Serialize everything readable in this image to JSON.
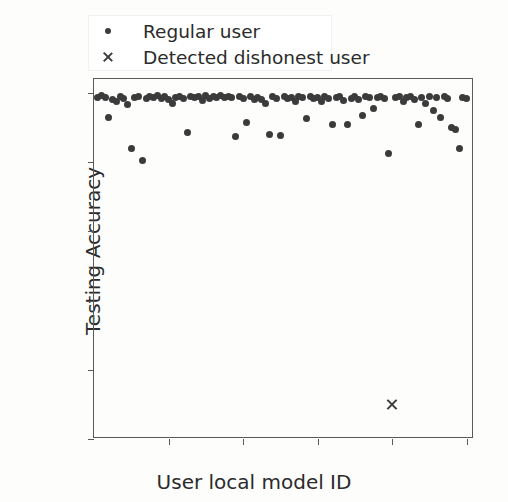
{
  "chart_data": {
    "type": "scatter",
    "title": "",
    "xlabel": "User local model ID",
    "ylabel": "Testing Accuracy",
    "xlim": [
      0,
      102
    ],
    "ylim": [
      0,
      104
    ],
    "xticks": [
      20,
      40,
      60,
      80,
      100
    ],
    "yticks": [
      0,
      20,
      40,
      60,
      80,
      100
    ],
    "grid": false,
    "legend_position": "upper left",
    "marker_color": "#3b3b3b",
    "axis_color": "#5a5a5a",
    "series": [
      {
        "name": "Regular user",
        "marker": "dot",
        "x": [
          1,
          2,
          3,
          4,
          5,
          6,
          7,
          8,
          9,
          10,
          11,
          12,
          13,
          14,
          15,
          16,
          17,
          18,
          19,
          20,
          21,
          22,
          23,
          24,
          25,
          26,
          27,
          28,
          29,
          30,
          31,
          32,
          33,
          34,
          35,
          36,
          37,
          38,
          39,
          40,
          41,
          42,
          43,
          44,
          45,
          46,
          47,
          48,
          49,
          50,
          51,
          52,
          53,
          54,
          55,
          56,
          57,
          58,
          59,
          60,
          61,
          62,
          63,
          64,
          65,
          66,
          67,
          68,
          69,
          70,
          71,
          72,
          73,
          74,
          75,
          76,
          77,
          78,
          79,
          81,
          82,
          83,
          84,
          85,
          86,
          87,
          88,
          89,
          90,
          91,
          92,
          93,
          94,
          95,
          96,
          97,
          98,
          99,
          100
        ],
        "y": [
          98.6,
          99.2,
          98.8,
          93.0,
          98.0,
          97.5,
          99.0,
          98.5,
          96.5,
          84.0,
          98.6,
          99.0,
          80.5,
          98.5,
          99.0,
          98.8,
          99.2,
          98.5,
          99.0,
          98.0,
          97.0,
          98.8,
          99.0,
          98.5,
          88.5,
          99.0,
          98.6,
          98.9,
          97.8,
          99.1,
          98.4,
          99.0,
          98.7,
          99.2,
          98.8,
          99.0,
          98.6,
          87.5,
          99.0,
          98.5,
          91.5,
          99.0,
          98.2,
          98.8,
          98.0,
          97.0,
          88.0,
          99.0,
          98.5,
          87.8,
          99.0,
          98.4,
          98.8,
          97.5,
          99.0,
          98.6,
          92.5,
          99.0,
          98.3,
          98.8,
          97.6,
          99.0,
          98.5,
          91.0,
          98.8,
          99.0,
          97.8,
          91.0,
          98.5,
          99.0,
          98.0,
          93.5,
          99.0,
          98.6,
          95.5,
          98.8,
          99.0,
          98.4,
          82.5,
          98.8,
          99.0,
          97.5,
          98.6,
          99.0,
          98.2,
          91.0,
          98.8,
          97.0,
          99.0,
          95.0,
          98.6,
          93.0,
          99.0,
          98.5,
          90.0,
          89.5,
          84.0,
          98.8,
          98.5
        ]
      },
      {
        "name": "Detected dishonest user",
        "marker": "x",
        "x": [
          80
        ],
        "y": [
          10
        ]
      }
    ]
  },
  "legend": {
    "items": [
      {
        "label": "Regular user",
        "marker": "dot"
      },
      {
        "label": "Detected dishonest user",
        "marker": "x"
      }
    ]
  }
}
